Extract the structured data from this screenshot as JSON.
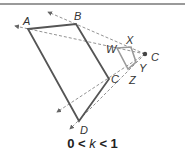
{
  "diagram": {
    "center": {
      "label": "C",
      "x": 145,
      "y": 54
    },
    "large_polygon": {
      "color": "#555555",
      "vertices": [
        {
          "label": "A",
          "x": 28,
          "y": 29
        },
        {
          "label": "B",
          "x": 76,
          "y": 24
        },
        {
          "label": "C",
          "x": 109,
          "y": 79
        },
        {
          "label": "D",
          "x": 79,
          "y": 121
        }
      ]
    },
    "small_polygon": {
      "color": "#9a9a9a",
      "vertices": [
        {
          "label": "W",
          "x": 117,
          "y": 48
        },
        {
          "label": "X",
          "x": 131,
          "y": 47
        },
        {
          "label": "Y",
          "x": 136,
          "y": 62
        },
        {
          "label": "Z",
          "x": 128,
          "y": 69
        }
      ]
    },
    "caption": {
      "left": "0",
      "op1": "<",
      "var": "k",
      "op2": "<",
      "right": "1"
    }
  }
}
